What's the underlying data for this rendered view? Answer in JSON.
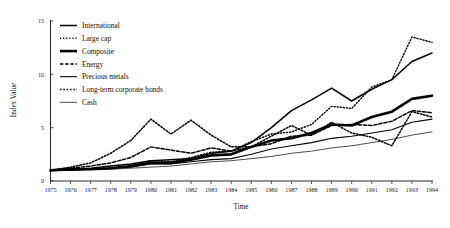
{
  "chart_data": {
    "type": "line",
    "title": "",
    "xlabel": "Time",
    "ylabel": "Index Value",
    "xlim": [
      1975,
      1994
    ],
    "ylim": [
      0,
      15
    ],
    "yticks": [
      "0",
      "5",
      "10",
      "15"
    ],
    "ytick_values": [
      0,
      5,
      10,
      15
    ],
    "grid": false,
    "legend_position": "top-left inside plot",
    "x": [
      1975,
      1976,
      1977,
      1978,
      1979,
      1980,
      1981,
      1982,
      1983,
      1984,
      1985,
      1986,
      1987,
      1988,
      1989,
      1990,
      1991,
      1992,
      1993,
      1994
    ],
    "xticks": [
      "1975",
      "1976",
      "1977",
      "1978",
      "1979",
      "1980",
      "1981",
      "1982",
      "1983",
      "1984",
      "1985",
      "1986",
      "1987",
      "1988",
      "1989",
      "1990",
      "1991",
      "1992",
      "1993",
      "1994"
    ],
    "series": [
      {
        "name": "International",
        "style": "solid-medium",
        "values": [
          1.0,
          1.1,
          1.2,
          1.4,
          1.6,
          1.9,
          2.0,
          2.1,
          2.6,
          2.8,
          3.6,
          5.0,
          6.6,
          7.6,
          8.7,
          7.5,
          8.6,
          9.5,
          11.2,
          12.0
        ]
      },
      {
        "name": "Large cap",
        "style": "dotted-fine",
        "values": [
          1.0,
          1.2,
          1.1,
          1.2,
          1.4,
          1.9,
          1.8,
          2.2,
          2.7,
          2.8,
          3.7,
          4.4,
          4.6,
          5.3,
          7.0,
          6.8,
          8.8,
          9.5,
          13.5,
          13.0
        ]
      },
      {
        "name": "Composite",
        "style": "solid-thick",
        "values": [
          1.0,
          1.1,
          1.1,
          1.2,
          1.4,
          1.7,
          1.7,
          2.0,
          2.4,
          2.5,
          3.2,
          3.8,
          4.0,
          4.5,
          5.3,
          5.2,
          6.0,
          6.5,
          7.7,
          8.0
        ]
      },
      {
        "name": "Energy",
        "style": "dashed-medium",
        "values": [
          1.0,
          1.2,
          1.4,
          1.7,
          2.2,
          3.2,
          2.9,
          2.6,
          3.1,
          2.8,
          3.2,
          3.5,
          4.2,
          4.3,
          5.2,
          5.3,
          5.2,
          5.6,
          6.6,
          6.4
        ]
      },
      {
        "name": "Precious metals",
        "style": "solid-thin",
        "values": [
          1.0,
          1.0,
          1.1,
          1.2,
          1.3,
          1.6,
          1.6,
          1.8,
          2.0,
          2.1,
          2.5,
          3.0,
          3.3,
          3.6,
          4.0,
          4.2,
          4.5,
          4.8,
          5.5,
          5.8
        ]
      },
      {
        "name": "Long-term corporate bonds",
        "style": "dotted-coarse",
        "values": [
          1.0,
          1.3,
          1.7,
          2.6,
          3.8,
          5.8,
          4.4,
          5.7,
          4.3,
          3.2,
          3.2,
          4.2,
          5.2,
          4.3,
          5.5,
          4.5,
          4.1,
          3.3,
          6.5,
          6.0
        ]
      },
      {
        "name": "Cash",
        "style": "solid-hairline",
        "values": [
          1.0,
          1.0,
          1.1,
          1.1,
          1.2,
          1.3,
          1.4,
          1.6,
          1.8,
          1.9,
          2.1,
          2.3,
          2.6,
          2.8,
          3.1,
          3.3,
          3.6,
          3.9,
          4.3,
          4.6
        ]
      }
    ]
  },
  "legend": {
    "items": [
      {
        "label": "International"
      },
      {
        "label": "Large cap"
      },
      {
        "label": "Composite"
      },
      {
        "label": "Energy"
      },
      {
        "label": "Precious metals"
      },
      {
        "label": "Long-term corporate bonds"
      },
      {
        "label": "Cash"
      }
    ]
  },
  "axes": {
    "y_title": "Index Value",
    "x_title": "Time"
  },
  "colors": {
    "line": "#000000",
    "axis": "#2b2b2b",
    "background": "#ffffff"
  }
}
